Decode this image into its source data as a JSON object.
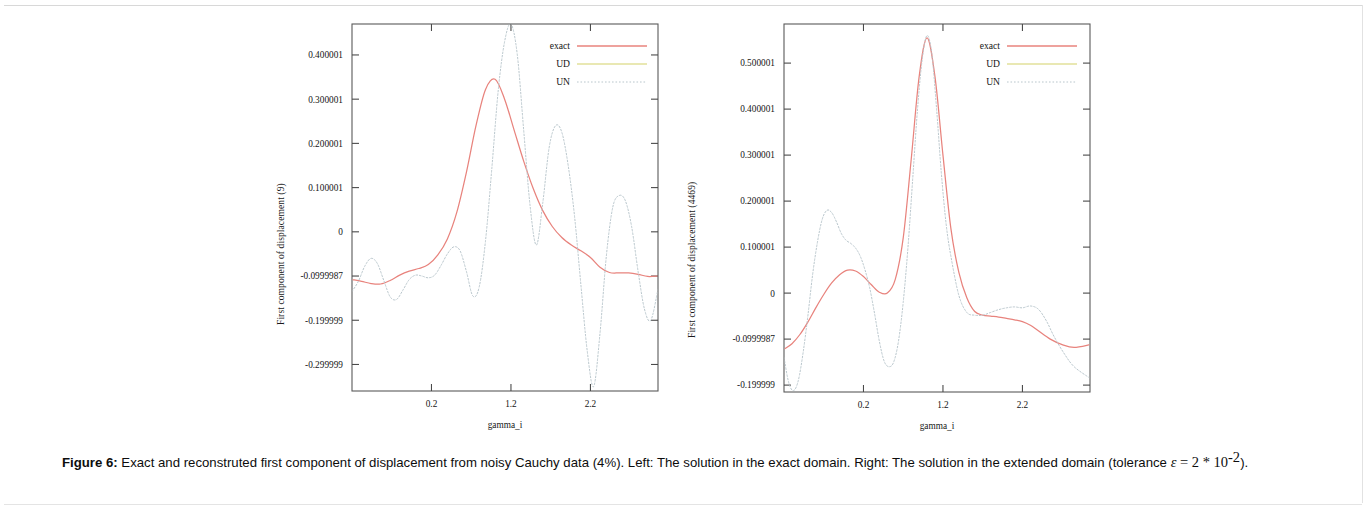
{
  "figure": {
    "label": "Figure  6:",
    "caption_line1": "Exact and reconstruted first component of displacement from noisy Cauchy data (4%). Left: The solution in the exact domain. Right: The solution",
    "caption_line2_pre": "in the extended domain (tolerance",
    "caption_eps": "ε",
    "caption_eq": " = 2 * 10",
    "caption_exp": "-2",
    "caption_line2_post": ")."
  },
  "legend": {
    "position": "top-right",
    "entries": [
      {
        "label": "exact",
        "color": "#e8837d",
        "style": "solid"
      },
      {
        "label": "UD",
        "color": "#e2e09a",
        "style": "solid"
      },
      {
        "label": "UN",
        "color": "#b9c6cc",
        "style": "dotted"
      }
    ]
  },
  "chart_data": [
    {
      "id": "left",
      "type": "line",
      "title": "",
      "xlabel": "gamma_i",
      "ylabel": "First component of displacement (9)",
      "xticklabels": [
        "0.2",
        "1.2",
        "2.2"
      ],
      "xtickvals": [
        0.2,
        1.2,
        2.2
      ],
      "yticklabels": [
        "0.400001",
        "0.300001",
        "0.200001",
        "0.100001",
        "0",
        "-0.0999987",
        "-0.199999",
        "-0.299999"
      ],
      "ytickvals": [
        0.400001,
        0.300001,
        0.200001,
        0.100001,
        0,
        -0.0999987,
        -0.199999,
        -0.299999
      ],
      "xlim": [
        -0.8,
        3.05
      ],
      "ylim": [
        -0.36,
        0.47
      ],
      "grid": false,
      "series": [
        {
          "name": "exact",
          "color": "#e8837d",
          "style": "solid",
          "x": [
            -0.8,
            -0.68,
            -0.56,
            -0.44,
            -0.32,
            -0.2,
            -0.08,
            0.04,
            0.16,
            0.28,
            0.4,
            0.52,
            0.64,
            0.76,
            0.88,
            1.0,
            1.12,
            1.24,
            1.36,
            1.48,
            1.6,
            1.72,
            1.84,
            1.96,
            2.08,
            2.2,
            2.32,
            2.44,
            2.56,
            2.68,
            2.8,
            2.92,
            3.05
          ],
          "y": [
            -0.108,
            -0.112,
            -0.117,
            -0.118,
            -0.11,
            -0.098,
            -0.089,
            -0.083,
            -0.074,
            -0.052,
            -0.016,
            0.045,
            0.135,
            0.24,
            0.322,
            0.345,
            0.3,
            0.23,
            0.16,
            0.098,
            0.048,
            0.012,
            -0.013,
            -0.03,
            -0.043,
            -0.058,
            -0.08,
            -0.092,
            -0.093,
            -0.093,
            -0.096,
            -0.101,
            -0.1
          ]
        },
        {
          "name": "UD",
          "color": "#e2e09a",
          "style": "solid",
          "x": [],
          "y": []
        },
        {
          "name": "UN",
          "color": "#b9c6cc",
          "style": "dotted",
          "x": [
            -0.8,
            -0.72,
            -0.64,
            -0.56,
            -0.48,
            -0.4,
            -0.32,
            -0.24,
            -0.16,
            -0.08,
            0.0,
            0.08,
            0.16,
            0.24,
            0.32,
            0.4,
            0.48,
            0.56,
            0.64,
            0.72,
            0.8,
            0.88,
            0.96,
            1.04,
            1.12,
            1.2,
            1.28,
            1.36,
            1.44,
            1.52,
            1.6,
            1.68,
            1.76,
            1.84,
            1.92,
            2.0,
            2.08,
            2.16,
            2.24,
            2.32,
            2.4,
            2.48,
            2.56,
            2.64,
            2.72,
            2.8,
            2.88,
            2.96,
            3.05
          ],
          "y": [
            -0.135,
            -0.112,
            -0.078,
            -0.06,
            -0.072,
            -0.11,
            -0.147,
            -0.153,
            -0.132,
            -0.108,
            -0.098,
            -0.1,
            -0.104,
            -0.098,
            -0.076,
            -0.05,
            -0.034,
            -0.043,
            -0.09,
            -0.145,
            -0.125,
            -0.02,
            0.145,
            0.32,
            0.43,
            0.47,
            0.4,
            0.23,
            0.06,
            -0.03,
            0.065,
            0.19,
            0.24,
            0.225,
            0.15,
            0.035,
            -0.12,
            -0.27,
            -0.35,
            -0.23,
            -0.055,
            0.055,
            0.082,
            0.07,
            0.01,
            -0.09,
            -0.175,
            -0.2,
            -0.13
          ]
        }
      ]
    },
    {
      "id": "right",
      "type": "line",
      "title": "",
      "xlabel": "gamma_i",
      "ylabel": "First component of displacement (4469)",
      "xticklabels": [
        "0.2",
        "1.2",
        "2.2"
      ],
      "xtickvals": [
        0.2,
        1.2,
        2.2
      ],
      "yticklabels": [
        "0.500001",
        "0.400001",
        "0.300001",
        "0.200001",
        "0.100001",
        "0",
        "-0.0999987",
        "-0.199999"
      ],
      "ytickvals": [
        0.500001,
        0.400001,
        0.300001,
        0.200001,
        0.100001,
        0,
        -0.0999987,
        -0.199999
      ],
      "xlim": [
        -0.8,
        3.05
      ],
      "ylim": [
        -0.215,
        0.585
      ],
      "grid": false,
      "series": [
        {
          "name": "exact",
          "color": "#e8837d",
          "style": "solid",
          "x": [
            -0.8,
            -0.7,
            -0.6,
            -0.5,
            -0.4,
            -0.3,
            -0.2,
            -0.1,
            0.0,
            0.1,
            0.2,
            0.3,
            0.4,
            0.5,
            0.6,
            0.7,
            0.8,
            0.9,
            1.0,
            1.1,
            1.2,
            1.3,
            1.4,
            1.5,
            1.6,
            1.7,
            1.8,
            1.9,
            2.0,
            2.1,
            2.2,
            2.3,
            2.4,
            2.55,
            2.7,
            2.85,
            3.05
          ],
          "y": [
            -0.122,
            -0.11,
            -0.09,
            -0.063,
            -0.032,
            -0.003,
            0.022,
            0.04,
            0.05,
            0.048,
            0.036,
            0.018,
            0.002,
            0.0,
            0.03,
            0.12,
            0.29,
            0.47,
            0.555,
            0.47,
            0.3,
            0.14,
            0.045,
            -0.01,
            -0.04,
            -0.048,
            -0.05,
            -0.052,
            -0.055,
            -0.058,
            -0.062,
            -0.07,
            -0.082,
            -0.1,
            -0.112,
            -0.118,
            -0.112
          ]
        },
        {
          "name": "UD",
          "color": "#e2e09a",
          "style": "solid",
          "x": [],
          "y": []
        },
        {
          "name": "UN",
          "color": "#b9c6cc",
          "style": "dotted",
          "x": [
            -0.8,
            -0.74,
            -0.68,
            -0.62,
            -0.56,
            -0.5,
            -0.44,
            -0.38,
            -0.32,
            -0.26,
            -0.2,
            -0.14,
            -0.08,
            -0.02,
            0.04,
            0.1,
            0.16,
            0.22,
            0.28,
            0.34,
            0.4,
            0.46,
            0.52,
            0.58,
            0.64,
            0.7,
            0.76,
            0.82,
            0.88,
            0.94,
            1.0,
            1.06,
            1.12,
            1.18,
            1.24,
            1.3,
            1.4,
            1.5,
            1.6,
            1.7,
            1.8,
            1.9,
            2.0,
            2.1,
            2.2,
            2.3,
            2.4,
            2.5,
            2.6,
            2.72,
            2.85,
            3.05
          ],
          "y": [
            -0.14,
            -0.195,
            -0.212,
            -0.19,
            -0.13,
            -0.05,
            0.04,
            0.11,
            0.16,
            0.18,
            0.175,
            0.155,
            0.13,
            0.115,
            0.108,
            0.098,
            0.08,
            0.05,
            0.01,
            -0.045,
            -0.105,
            -0.148,
            -0.16,
            -0.15,
            -0.105,
            -0.02,
            0.1,
            0.25,
            0.4,
            0.51,
            0.56,
            0.52,
            0.4,
            0.26,
            0.15,
            0.08,
            -0.005,
            -0.042,
            -0.048,
            -0.048,
            -0.042,
            -0.036,
            -0.032,
            -0.03,
            -0.032,
            -0.028,
            -0.035,
            -0.06,
            -0.095,
            -0.13,
            -0.16,
            -0.185
          ]
        }
      ]
    }
  ]
}
